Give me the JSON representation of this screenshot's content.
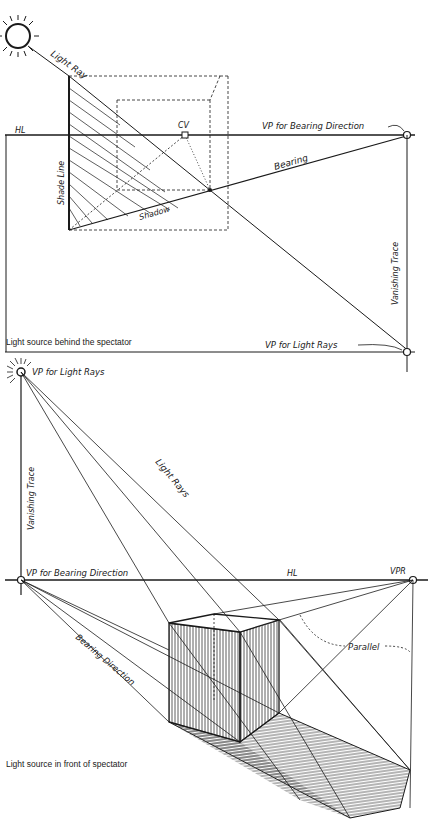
{
  "top_diagram": {
    "title": "Light source behind the spectator",
    "labels": {
      "light_ray": "Light Ray",
      "horizon_line": "HL",
      "center_of_vision": "CV",
      "vp_bearing": "VP for Bearing Direction",
      "bearing": "Bearing",
      "shade_line": "Shade Line",
      "shadow": "Shadow",
      "vanishing_trace": "Vanishing Trace",
      "vp_light_rays": "VP for Light Rays"
    }
  },
  "bottom_diagram": {
    "title": "Light source in front of spectator",
    "labels": {
      "vp_light_rays": "VP for Light Rays",
      "vanishing_trace": "Vanishing Trace",
      "light_rays": "Light Rays",
      "vp_bearing": "VP for Bearing Direction",
      "horizon_line": "HL",
      "vpr": "VPR",
      "parallel": "Parallel",
      "bearing_direction": "Bearing Direction"
    }
  },
  "colors": {
    "ink": "#1a1a1a",
    "paper": "#ffffff",
    "hatch": "#555555"
  }
}
